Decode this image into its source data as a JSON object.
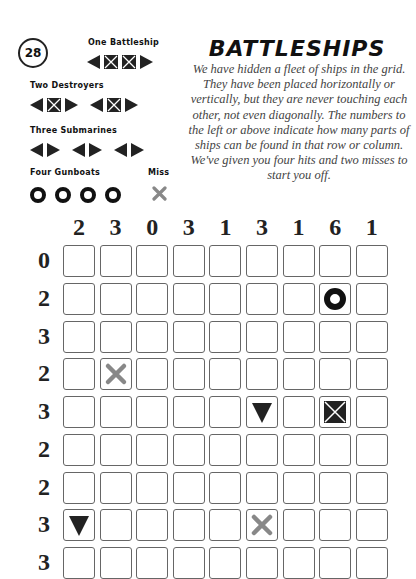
{
  "page_number": "28",
  "title": "BATTLESHIPS",
  "description": "We have hidden a fleet of ships in the grid. They have been placed horizontally or vertically, but they are never touching each other, not even diagonally. The numbers to the left or above indicate how many parts of ships can be found in that row or column. We've given you four hits and two misses to start you off.",
  "fleet": {
    "battleship_label": "One Battleship",
    "destroyers_label": "Two Destroyers",
    "submarines_label": "Three Submarines",
    "gunboats_label": "Four Gunboats",
    "miss_label": "Miss"
  },
  "colors": {
    "ship": "#222222",
    "miss": "#888888",
    "cell_border": "#666666",
    "text": "#111111"
  },
  "grid": {
    "column_clues": [
      "2",
      "3",
      "0",
      "3",
      "1",
      "3",
      "1",
      "6",
      "1"
    ],
    "row_clues": [
      "0",
      "2",
      "3",
      "2",
      "3",
      "2",
      "2",
      "3",
      "3"
    ],
    "givens": [
      {
        "row": 1,
        "col": 7,
        "type": "gunboat"
      },
      {
        "row": 3,
        "col": 1,
        "type": "miss"
      },
      {
        "row": 4,
        "col": 5,
        "type": "end-down"
      },
      {
        "row": 4,
        "col": 7,
        "type": "middle"
      },
      {
        "row": 7,
        "col": 0,
        "type": "end-down"
      },
      {
        "row": 7,
        "col": 5,
        "type": "miss"
      }
    ]
  }
}
